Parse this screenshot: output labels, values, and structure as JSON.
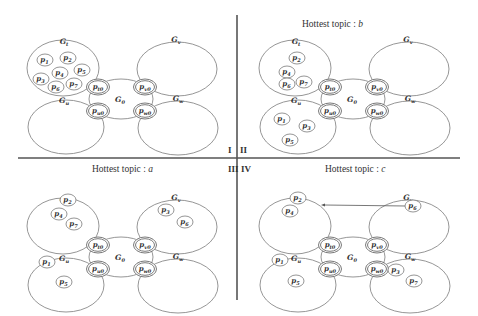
{
  "figure": {
    "dividers": {
      "vertical": {
        "x": 237,
        "y1": 15,
        "y2": 300
      },
      "horizontal": {
        "y": 158,
        "x1": 18,
        "x2": 460
      }
    },
    "quadrants": [
      {
        "id": "I",
        "roman": "I",
        "roman_pos": [
          228,
          153
        ],
        "title": "",
        "title_pos": [
          0,
          0
        ],
        "ox": 0,
        "oy": 0,
        "peers": {
          "Gt": [
            [
              "1",
              45,
              60
            ],
            [
              "2",
              68,
              58
            ],
            [
              "3",
              41,
              79
            ],
            [
              "4",
              60,
              73
            ],
            [
              "5",
              82,
              70
            ],
            [
              "6",
              56,
              87
            ],
            [
              "7",
              74,
              84
            ]
          ],
          "Gv": [],
          "Gu": [],
          "Gw": []
        },
        "arrow": null
      },
      {
        "id": "II",
        "roman": "II",
        "roman_pos": [
          240,
          153
        ],
        "title": "Hottest topic : ",
        "title_var": "b",
        "title_pos": [
          302,
          27
        ],
        "ox": 232,
        "oy": 0,
        "peers": {
          "Gt": [
            [
              "2",
              297,
              58
            ],
            [
              "4",
              287,
              72
            ],
            [
              "6",
              287,
              84
            ],
            [
              "7",
              304,
              82
            ]
          ],
          "Gu": [
            [
              "1",
              282,
              119
            ],
            [
              "3",
              307,
              126
            ],
            [
              "5",
              290,
              140
            ]
          ],
          "Gv": [],
          "Gw": []
        },
        "arrow": null
      },
      {
        "id": "III",
        "roman": "III",
        "roman_pos": [
          228,
          172
        ],
        "title": "Hottest topic : ",
        "title_var": "a",
        "title_pos": [
          92,
          172
        ],
        "ox": 0,
        "oy": 158,
        "peers": {
          "Gt": [
            [
              "2",
              68,
              200
            ],
            [
              "4",
              59,
              214
            ],
            [
              "7",
              74,
              224
            ]
          ],
          "Gv": [
            [
              "3",
              166,
              210
            ],
            [
              "6",
              185,
              222
            ]
          ],
          "Gu": [
            [
              "1",
              47,
              262
            ],
            [
              "5",
              64,
              282
            ]
          ],
          "Gw": []
        },
        "arrow": null
      },
      {
        "id": "IV",
        "roman": "IV",
        "roman_pos": [
          241,
          172
        ],
        "title": "Hottest topic : ",
        "title_var": "c",
        "title_pos": [
          325,
          172
        ],
        "ox": 232,
        "oy": 158,
        "peers": {
          "Gt": [
            [
              "2",
              298,
              198
            ],
            [
              "4",
              290,
              211
            ]
          ],
          "Gv": [
            [
              "6",
              413,
              206
            ]
          ],
          "Gu": [
            [
              "1",
              280,
              260
            ],
            [
              "5",
              296,
              281
            ]
          ],
          "Gw": [
            [
              "3",
              396,
              270
            ],
            [
              "7",
              414,
              281
            ]
          ]
        },
        "arrow": {
          "from": [
            406,
            206
          ],
          "to": [
            321,
            205
          ]
        }
      }
    ],
    "base_layout": {
      "groups": {
        "Gt": {
          "cx": 63,
          "cy": 68,
          "rx": 36,
          "ry": 28,
          "label": "G",
          "sub": "t",
          "lx": 64,
          "ly": 44
        },
        "Gv": {
          "cx": 177,
          "cy": 69,
          "rx": 40,
          "ry": 27,
          "label": "G",
          "sub": "v",
          "lx": 176,
          "ly": 42
        },
        "Gu": {
          "cx": 66,
          "cy": 127,
          "rx": 38,
          "ry": 27,
          "label": "G",
          "sub": "u",
          "lx": 64,
          "ly": 103
        },
        "Gw": {
          "cx": 178,
          "cy": 128,
          "rx": 40,
          "ry": 27,
          "label": "G",
          "sub": "w",
          "lx": 178,
          "ly": 101
        },
        "G0": {
          "cx": 121,
          "cy": 99,
          "rx": 32,
          "ry": 20,
          "label": "G",
          "sub": "0",
          "lx": 120,
          "ly": 102
        }
      },
      "gateways": [
        {
          "label": "p",
          "sub": "t0",
          "x": 98,
          "y": 87
        },
        {
          "label": "p",
          "sub": "v0",
          "x": 145,
          "y": 87
        },
        {
          "label": "p",
          "sub": "u0",
          "x": 98,
          "y": 111
        },
        {
          "label": "p",
          "sub": "w0",
          "x": 145,
          "y": 111
        }
      ]
    },
    "colors": {
      "stroke": "#8a8a8a",
      "text": "#333333",
      "divider": "#555555",
      "background": "#ffffff"
    }
  }
}
